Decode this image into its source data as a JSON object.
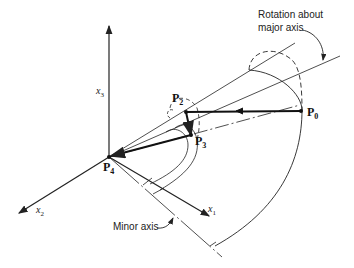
{
  "diagram": {
    "annotations": {
      "rotation": "Rotation about\nmajor axis",
      "rotation_line1": "Rotation about",
      "rotation_line2": "major axis",
      "minor_axis": "Minor axis"
    },
    "axes": [
      {
        "name": "x",
        "sub": "1"
      },
      {
        "name": "x",
        "sub": "2"
      },
      {
        "name": "x",
        "sub": "3"
      }
    ],
    "points": [
      {
        "name": "P",
        "sub": "0"
      },
      {
        "name": "P",
        "sub": "2"
      },
      {
        "name": "P",
        "sub": "3"
      },
      {
        "name": "P",
        "sub": "4"
      }
    ],
    "colors": {
      "line": "#222222",
      "background": "#ffffff"
    }
  }
}
